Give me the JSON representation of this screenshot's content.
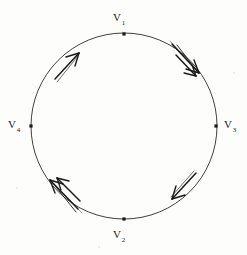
{
  "figure": {
    "background_color": "#fdfdfc",
    "ink_color": "#1b1b1b",
    "width": 247,
    "height": 255
  },
  "circle": {
    "center_x": 124,
    "center_y": 126,
    "radius": 93,
    "stroke_color": "#2a2a2a",
    "stroke_width": 0.9
  },
  "vertices": [
    {
      "id": "v1",
      "label": "V",
      "subscript": "1",
      "angle_deg": -90,
      "x": 124,
      "y": 34
    },
    {
      "id": "v3",
      "label": "V",
      "subscript": "3",
      "angle_deg": 0,
      "x": 216,
      "y": 126
    },
    {
      "id": "v2",
      "label": "V",
      "subscript": "2",
      "angle_deg": 90,
      "x": 124,
      "y": 219
    },
    {
      "id": "v4",
      "label": "V",
      "subscript": "4",
      "angle_deg": 180,
      "x": 31,
      "y": 126
    }
  ],
  "arrows": [
    {
      "id": "arrow-upper-right-outer",
      "position_angle_deg": -43,
      "direction": "clockwise",
      "count": 1,
      "description": "arrowhead on arc from V1 to V3 pointing clockwise"
    },
    {
      "id": "arrow-upper-right-inner",
      "position_angle_deg": -52,
      "direction": "clockwise",
      "count": 1,
      "description": "second arrowhead on arc from V1 to V3 pointing clockwise"
    },
    {
      "id": "arrow-upper-left",
      "position_angle_deg": -142,
      "direction": "clockwise",
      "count": 1,
      "description": "arrowhead on arc from V4 to V1 pointing up-right"
    },
    {
      "id": "arrow-lower-right",
      "position_angle_deg": 47,
      "direction": "counterclockwise",
      "count": 1,
      "description": "arrowhead on arc between V3 and V2 pointing down-left"
    },
    {
      "id": "arrow-lower-left-outer",
      "position_angle_deg": 136,
      "direction": "counterclockwise",
      "count": 1,
      "description": "arrowhead on arc from V2 to V4 pointing up-left"
    },
    {
      "id": "arrow-lower-left-inner",
      "position_angle_deg": 127,
      "direction": "counterclockwise",
      "count": 1,
      "description": "second arrowhead on arc from V2 to V4 pointing up-left"
    }
  ],
  "labels": {
    "v1": {
      "text": "V",
      "sub": "1"
    },
    "v2": {
      "text": "V",
      "sub": "2"
    },
    "v3": {
      "text": "V",
      "sub": "3"
    },
    "v4": {
      "text": "V",
      "sub": "4"
    }
  }
}
